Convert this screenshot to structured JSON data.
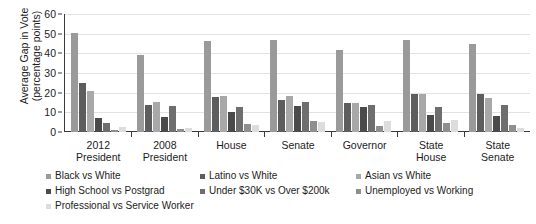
{
  "chart_data": {
    "type": "bar",
    "title": "",
    "xlabel": "",
    "ylabel": "Average Gap in Vote (percentage points)",
    "ylabel_line1": "Average Gap in Vote",
    "ylabel_line2": "(percentage points)",
    "ylim": [
      0,
      60
    ],
    "yticks": [
      0,
      10,
      20,
      30,
      40,
      50,
      60
    ],
    "grid": true,
    "legend_position": "bottom",
    "categories": [
      "2012 President",
      "2008 President",
      "House",
      "Senate",
      "Governor",
      "State House",
      "State Senate"
    ],
    "category_lines": [
      [
        "2012",
        "President"
      ],
      [
        "2008",
        "President"
      ],
      [
        "House",
        ""
      ],
      [
        "Senate",
        ""
      ],
      [
        "Governor",
        ""
      ],
      [
        "State",
        "House"
      ],
      [
        "State",
        "Senate"
      ]
    ],
    "series": [
      {
        "name": "Black vs White",
        "color": "#9a9a9a",
        "values": [
          50.2,
          39.0,
          46.5,
          47.0,
          41.5,
          47.0,
          45.0
        ]
      },
      {
        "name": "Latino vs White",
        "color": "#5d5d5d",
        "values": [
          25.0,
          13.8,
          18.0,
          16.5,
          15.0,
          19.5,
          19.5
        ]
      },
      {
        "name": "Asian vs White",
        "color": "#a8a8a8",
        "values": [
          21.0,
          15.2,
          18.5,
          18.5,
          14.5,
          19.5,
          17.5
        ]
      },
      {
        "name": "High School vs Postgrad",
        "color": "#4a4a4a",
        "values": [
          7.0,
          7.5,
          10.0,
          13.0,
          12.5,
          8.5,
          8.0
        ]
      },
      {
        "name": "Under $30K vs Over $200k",
        "color": "#6e6e6e",
        "values": [
          4.5,
          13.0,
          12.5,
          15.5,
          13.5,
          12.5,
          13.5
        ]
      },
      {
        "name": "Unemployed vs Working",
        "color": "#8f8f8f",
        "values": [
          1.2,
          1.5,
          4.0,
          5.5,
          3.0,
          4.5,
          3.5
        ]
      },
      {
        "name": "Professional vs Service Worker",
        "color": "#dcdcdc",
        "values": [
          2.5,
          1.8,
          3.5,
          5.0,
          5.5,
          6.0,
          2.0
        ]
      }
    ]
  },
  "axis": {
    "y_title_line1": "Average Gap in Vote",
    "y_title_line2": "(percentage points)"
  }
}
